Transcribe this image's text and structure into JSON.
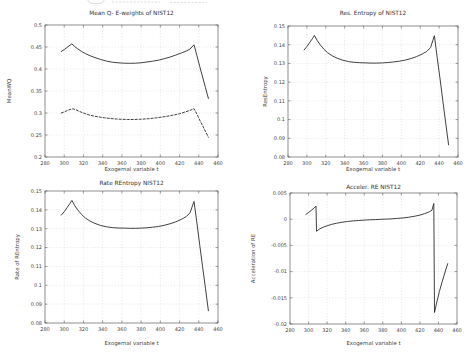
{
  "chart_data": [
    {
      "type": "line",
      "title": "Mean Q- E-weights of NIST12",
      "xlabel": "Exogernal variable t",
      "ylabel": "MeanWQ",
      "xlim": [
        280,
        460
      ],
      "ylim": [
        0.2,
        0.5
      ],
      "xticks": [
        280,
        300,
        320,
        340,
        360,
        380,
        400,
        420,
        440,
        460
      ],
      "xtick_labels": [
        "280",
        "300",
        "320",
        "340",
        "360",
        "380",
        "400",
        "420",
        "440",
        "460"
      ],
      "yticks": [
        0.2,
        0.25,
        0.3,
        0.35,
        0.4,
        0.45,
        0.5
      ],
      "ytick_labels": [
        "0.2",
        "0.25",
        "0.3",
        "0.35",
        "0.4",
        "0.45",
        "0.5"
      ],
      "grid": true,
      "legend": null,
      "series": [
        {
          "name": "mean-wq-solid",
          "dash": false,
          "x": [
            297,
            300,
            303,
            306,
            308,
            311,
            314,
            318,
            322,
            327,
            332,
            338,
            344,
            350,
            356,
            362,
            368,
            374,
            380,
            386,
            392,
            398,
            404,
            410,
            416,
            422,
            427,
            431,
            435,
            438,
            441,
            444,
            447,
            450
          ],
          "y": [
            0.44,
            0.444,
            0.449,
            0.454,
            0.457,
            0.451,
            0.446,
            0.44,
            0.435,
            0.43,
            0.426,
            0.4215,
            0.418,
            0.4155,
            0.414,
            0.4132,
            0.413,
            0.4132,
            0.4142,
            0.4158,
            0.4178,
            0.42,
            0.4235,
            0.427,
            0.4315,
            0.4365,
            0.441,
            0.4455,
            0.455,
            0.4306,
            0.4062,
            0.3818,
            0.3574,
            0.333
          ]
        },
        {
          "name": "mean-wq-dashed",
          "dash": true,
          "x": [
            297,
            300,
            303,
            306,
            309,
            312,
            316,
            320,
            325,
            330,
            336,
            342,
            348,
            354,
            360,
            366,
            372,
            378,
            384,
            390,
            396,
            402,
            408,
            414,
            420,
            426,
            431,
            435,
            438,
            441,
            444,
            447,
            450
          ],
          "y": [
            0.3,
            0.3025,
            0.3055,
            0.308,
            0.3095,
            0.3075,
            0.3035,
            0.3,
            0.2962,
            0.2935,
            0.291,
            0.289,
            0.2875,
            0.2863,
            0.2856,
            0.2852,
            0.2852,
            0.2856,
            0.2863,
            0.2875,
            0.289,
            0.2908,
            0.293,
            0.2955,
            0.2985,
            0.3025,
            0.306,
            0.31,
            0.2975,
            0.284,
            0.271,
            0.258,
            0.245
          ]
        }
      ]
    },
    {
      "type": "line",
      "title": "Res. Entropy of NIST12",
      "xlabel": "Exogernal variable t",
      "ylabel": "ResEntropy",
      "xlim": [
        280,
        460
      ],
      "ylim": [
        0.08,
        0.15
      ],
      "xticks": [
        280,
        300,
        320,
        340,
        360,
        380,
        400,
        420,
        440,
        460
      ],
      "xtick_labels": [
        "280",
        "300",
        "320",
        "340",
        "360",
        "380",
        "400",
        "420",
        "440",
        "460"
      ],
      "yticks": [
        0.08,
        0.09,
        0.1,
        0.11,
        0.12,
        0.13,
        0.14,
        0.15
      ],
      "ytick_labels": [
        "0.08",
        "0.09",
        "0.1",
        "0.11",
        "0.12",
        "0.13",
        "0.14",
        "0.15"
      ],
      "grid": true,
      "legend": null,
      "series": [
        {
          "name": "res-entropy",
          "dash": false,
          "x": [
            297,
            300,
            303,
            306,
            308,
            311,
            314,
            318,
            322,
            327,
            332,
            338,
            344,
            350,
            356,
            362,
            368,
            374,
            380,
            386,
            392,
            398,
            404,
            410,
            416,
            422,
            427,
            431,
            435,
            438,
            441,
            444,
            447,
            450
          ],
          "y": [
            0.1372,
            0.139,
            0.1412,
            0.1434,
            0.145,
            0.1422,
            0.14,
            0.1376,
            0.1357,
            0.134,
            0.1328,
            0.1317,
            0.131,
            0.1306,
            0.1304,
            0.1303,
            0.1302,
            0.1302,
            0.1303,
            0.1305,
            0.1308,
            0.1312,
            0.1318,
            0.1326,
            0.1336,
            0.135,
            0.1365,
            0.1385,
            0.1448,
            0.1331,
            0.1215,
            0.1098,
            0.0982,
            0.0865
          ]
        }
      ]
    },
    {
      "type": "line",
      "title": "Rate REntropy NIST12",
      "xlabel": "Exogernal variable t",
      "ylabel": "Rate of REntropy",
      "xlim": [
        280,
        460
      ],
      "ylim": [
        0.08,
        0.15
      ],
      "xticks": [
        280,
        300,
        320,
        340,
        360,
        380,
        400,
        420,
        440,
        460
      ],
      "xtick_labels": [
        "280",
        "300",
        "320",
        "340",
        "360",
        "380",
        "400",
        "420",
        "440",
        "460"
      ],
      "yticks": [
        0.08,
        0.09,
        0.1,
        0.11,
        0.12,
        0.13,
        0.14,
        0.15
      ],
      "ytick_labels": [
        "0.08",
        "0.09",
        "0.1",
        "0.11",
        "0.12",
        "0.13",
        "0.14",
        "0.15"
      ],
      "grid": true,
      "legend": null,
      "series": [
        {
          "name": "rate-rentropy",
          "dash": false,
          "x": [
            297,
            300,
            303,
            306,
            308,
            311,
            314,
            318,
            322,
            327,
            332,
            338,
            344,
            350,
            356,
            362,
            368,
            374,
            380,
            386,
            392,
            398,
            404,
            410,
            416,
            422,
            427,
            431,
            435,
            438,
            441,
            444,
            447,
            450
          ],
          "y": [
            0.1372,
            0.139,
            0.1412,
            0.1434,
            0.145,
            0.1422,
            0.14,
            0.1376,
            0.1357,
            0.134,
            0.1328,
            0.1317,
            0.131,
            0.1306,
            0.1304,
            0.1303,
            0.1302,
            0.1302,
            0.1303,
            0.1305,
            0.1308,
            0.1312,
            0.1318,
            0.1326,
            0.1336,
            0.135,
            0.1365,
            0.1385,
            0.1445,
            0.1331,
            0.1215,
            0.1098,
            0.0982,
            0.0865
          ]
        }
      ]
    },
    {
      "type": "line",
      "title": "Acceler. RE NIST12",
      "xlabel": "Exogernal variable t",
      "ylabel": "Acceleration of RE",
      "xlim": [
        280,
        460
      ],
      "ylim": [
        -0.02,
        0.005
      ],
      "xticks": [
        280,
        300,
        320,
        340,
        360,
        380,
        400,
        420,
        440,
        460
      ],
      "xtick_labels": [
        "280",
        "300",
        "320",
        "340",
        "360",
        "380",
        "400",
        "420",
        "440",
        "460"
      ],
      "yticks": [
        -0.02,
        -0.015,
        -0.01,
        -0.005,
        0,
        0.005
      ],
      "ytick_labels": [
        "-0.02",
        "-0.015",
        "-0.01",
        "-0.005",
        "0",
        "0.005"
      ],
      "grid": true,
      "legend": null,
      "series": [
        {
          "name": "acceleration-re",
          "dash": false,
          "x": [
            297,
            300,
            303,
            306,
            308,
            308.6,
            312,
            316,
            320,
            325,
            330,
            336,
            342,
            348,
            354,
            360,
            366,
            372,
            378,
            384,
            390,
            396,
            402,
            408,
            414,
            420,
            425,
            430,
            433,
            435,
            435.8,
            438,
            441,
            444,
            447,
            450
          ],
          "y": [
            0.0009,
            0.0013,
            0.0017,
            0.0021,
            0.0025,
            -0.0023,
            -0.00185,
            -0.0015,
            -0.00125,
            -0.00098,
            -0.00078,
            -0.00058,
            -0.00044,
            -0.00033,
            -0.00025,
            -0.00018,
            -0.00012,
            -7e-05,
            -2e-05,
            2e-05,
            8e-05,
            0.00015,
            0.00025,
            0.00038,
            0.00055,
            0.00078,
            0.00105,
            0.0014,
            0.0017,
            0.003,
            -0.0178,
            -0.016,
            -0.0138,
            -0.0119,
            -0.0102,
            -0.0085
          ]
        }
      ]
    }
  ]
}
